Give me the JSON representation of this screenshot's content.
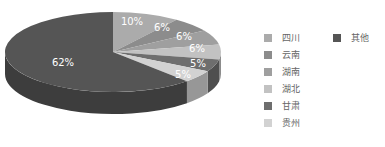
{
  "chart_data": {
    "type": "pie",
    "style": "3d",
    "title": "",
    "categories": [
      "四川",
      "云南",
      "湖南",
      "湖北",
      "甘肃",
      "贵州",
      "其他"
    ],
    "values": [
      10,
      6,
      6,
      6,
      5,
      5,
      62
    ],
    "labels": [
      "10%",
      "6%",
      "6%",
      "6%",
      "5%",
      "5%",
      "62%"
    ],
    "colors": [
      "#ababab",
      "#8c8c8c",
      "#9f9f9f",
      "#c2c2c2",
      "#6e6e6e",
      "#d2d2d2",
      "#555555"
    ],
    "legend_position": "right"
  },
  "legend": {
    "items": [
      {
        "label": "四川",
        "color": "#ababab"
      },
      {
        "label": "云南",
        "color": "#8c8c8c"
      },
      {
        "label": "湖南",
        "color": "#9f9f9f"
      },
      {
        "label": "湖北",
        "color": "#c2c2c2"
      },
      {
        "label": "甘肃",
        "color": "#6e6e6e"
      },
      {
        "label": "贵州",
        "color": "#d2d2d2"
      },
      {
        "label": "其他",
        "color": "#555555"
      }
    ]
  }
}
